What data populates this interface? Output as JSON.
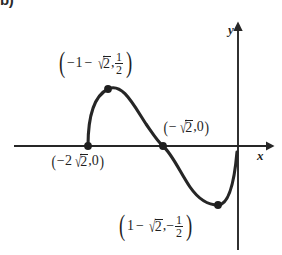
{
  "figure": {
    "kind": "coordinate-graph",
    "background_color": "#ffffff",
    "ink_color": "#1f1f1f",
    "corner_enumeration": "b)",
    "axes": {
      "x_label": "x",
      "y_label": "y",
      "x_axis_y_px": 146,
      "y_axis_x_px": 238
    },
    "labels": {
      "maximum": {
        "open_paren": "(",
        "close_paren": ")",
        "x_lead_minus": "−",
        "x_one": "1",
        "x_minus": "−",
        "radical_check": "√",
        "radicand": "2",
        "comma": ",",
        "y_num": "1",
        "y_den": "2"
      },
      "left_root": {
        "open_paren": "(",
        "close_paren": ")",
        "minus": "−",
        "coefficient": "2",
        "radical_check": "√",
        "radicand": "2",
        "comma_zero": ",0"
      },
      "middle_root": {
        "open_paren": "(",
        "close_paren": ")",
        "minus": "−",
        "radical_check": "√",
        "radicand": "2",
        "comma_zero": ",0"
      },
      "minimum": {
        "open_paren": "(",
        "close_paren": ")",
        "x_one": "1",
        "x_minus": "−",
        "radical_check": "√",
        "radicand": "2",
        "comma": ",",
        "y_minus": "−",
        "y_num": "1",
        "y_den": "2"
      }
    },
    "points": [
      {
        "name": "left-root",
        "x_px": 88,
        "y_px": 146,
        "label": "(-2√2, 0)"
      },
      {
        "name": "maximum",
        "x_px": 108,
        "y_px": 89,
        "label": "(-1-√2, 1/2)"
      },
      {
        "name": "middle-root",
        "x_px": 163,
        "y_px": 146,
        "label": "(-√2, 0)"
      },
      {
        "name": "minimum",
        "x_px": 218,
        "y_px": 205,
        "label": "(1-√2, -1/2)"
      }
    ]
  }
}
